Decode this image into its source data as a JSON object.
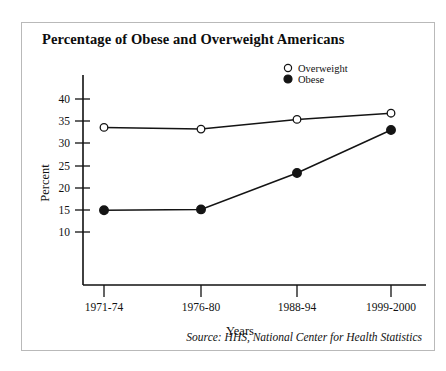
{
  "figure": {
    "title": "Percentage of Obese and Overweight Americans",
    "source": "Source: HHS, National Center for Health Statistics"
  },
  "chart_data": {
    "type": "line",
    "title": "Percentage of Obese and Overweight Americans",
    "xlabel": "Years",
    "ylabel": "Percent",
    "categories": [
      "1971-74",
      "1976-80",
      "1988-94",
      "1999-2000"
    ],
    "yticks": [
      10,
      15,
      20,
      25,
      30,
      35,
      40
    ],
    "ylim": [
      7,
      42
    ],
    "grid": false,
    "legend_position": "top-right",
    "series": [
      {
        "name": "Overweight",
        "marker": "open-circle",
        "values": [
          33.6,
          33.2,
          35.4,
          36.8
        ]
      },
      {
        "name": "Obese",
        "marker": "filled-circle",
        "values": [
          14.9,
          15.1,
          23.3,
          33.0
        ]
      }
    ]
  },
  "legend": {
    "items": [
      {
        "label": "Overweight",
        "marker": "open-circle"
      },
      {
        "label": "Obese",
        "marker": "filled-circle"
      }
    ]
  },
  "colors": {
    "ink": "#141414",
    "card_border": "#b9b9b9",
    "background": "#ffffff"
  }
}
